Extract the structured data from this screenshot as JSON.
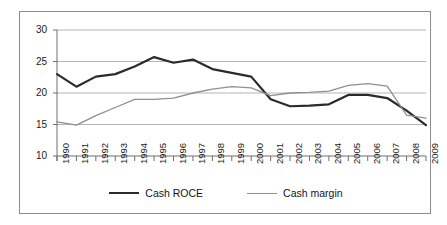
{
  "chart_data": {
    "type": "line",
    "title": "",
    "subtitle": "",
    "xlabel": "",
    "ylabel": "",
    "categories": [
      "1990",
      "1991",
      "1992",
      "1993",
      "1994",
      "1995",
      "1996",
      "1997",
      "1998",
      "1999",
      "2000",
      "2001",
      "2002",
      "2003",
      "2004",
      "2005",
      "2006",
      "2007",
      "2008",
      "2009"
    ],
    "ylim": [
      10,
      30
    ],
    "yticks": [
      10,
      15,
      20,
      25,
      30
    ],
    "ytick_labels": [
      "10",
      "15",
      "20",
      "25",
      "30"
    ],
    "grid": "horizontal",
    "legend_position": "bottom",
    "series": [
      {
        "name": "Cash ROCE",
        "color": "#2b2b2b",
        "width": 2.2,
        "values": [
          23.0,
          21.0,
          22.6,
          23.0,
          24.2,
          25.7,
          24.8,
          25.3,
          23.8,
          23.2,
          22.6,
          19.0,
          17.9,
          18.0,
          18.2,
          19.7,
          19.7,
          19.2,
          17.2,
          14.9
        ]
      },
      {
        "name": "Cash margin",
        "color": "#8f8f8f",
        "width": 1.3,
        "values": [
          15.4,
          14.9,
          16.4,
          17.7,
          19.0,
          19.0,
          19.2,
          20.0,
          20.6,
          21.0,
          20.8,
          19.6,
          20.0,
          20.1,
          20.3,
          21.2,
          21.5,
          21.1,
          16.5,
          16.0
        ]
      }
    ]
  },
  "legend": {
    "entries": [
      {
        "label": "Cash ROCE"
      },
      {
        "label": "Cash margin"
      }
    ]
  },
  "colors": {
    "frame": "#8c8c8c",
    "gridline": "#b5b5b5",
    "axis": "#6e6e6e",
    "series_roce": "#2b2b2b",
    "series_margin": "#8f8f8f",
    "text": "#1a1a1a",
    "background": "#ffffff"
  }
}
